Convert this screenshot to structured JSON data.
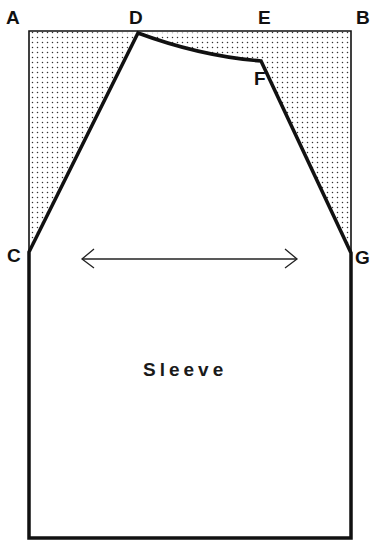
{
  "diagram": {
    "type": "sewing-pattern",
    "piece_label": "Sleeve",
    "points": {
      "A": "A",
      "B": "B",
      "C": "C",
      "D": "D",
      "E": "E",
      "F": "F",
      "G": "G"
    },
    "grainline": "double-headed-arrow",
    "colors": {
      "line": "#111111",
      "dot_fill": "#333333",
      "background": "#ffffff"
    }
  }
}
